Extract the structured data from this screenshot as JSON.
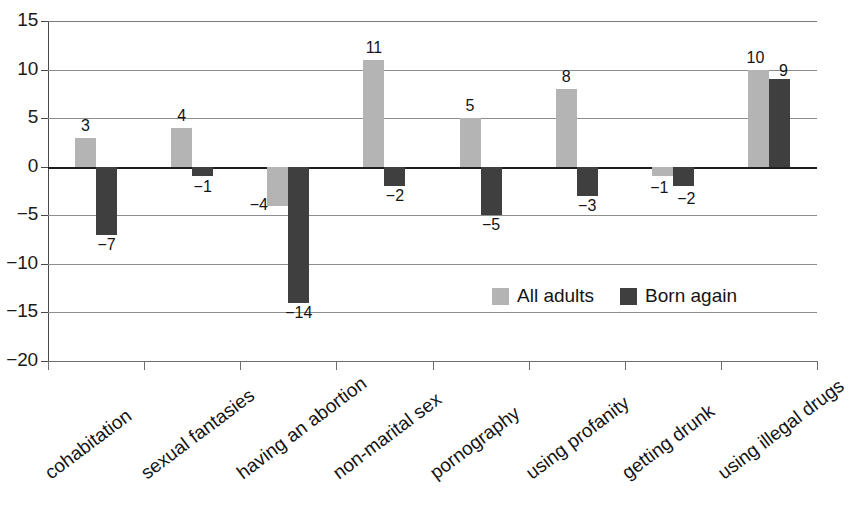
{
  "chart_data": {
    "type": "bar",
    "title": "",
    "subtitle": "",
    "xlabel": "",
    "ylabel": "",
    "ylim": [
      -20,
      15
    ],
    "ytick_values": [
      15,
      10,
      5,
      0,
      -5,
      -10,
      -15,
      -20
    ],
    "ytick_labels": [
      "15",
      "10",
      "5",
      "0",
      "−5",
      "−10",
      "−15",
      "−20"
    ],
    "grid": true,
    "legend_position": "inside-lower-right",
    "categories": [
      "cohabitation",
      "sexual fantasies",
      "having an abortion",
      "non-marital sex",
      "pornography",
      "using profanity",
      "getting drunk",
      "using illegal drugs"
    ],
    "series": [
      {
        "name": "All adults",
        "color": "#b4b4b4",
        "values": [
          3,
          4,
          -4,
          11,
          5,
          8,
          -1,
          10
        ],
        "labels": [
          "3",
          "4",
          "−4",
          "11",
          "5",
          "8",
          "−1",
          "10"
        ]
      },
      {
        "name": "Born again",
        "color": "#3f3f3f",
        "values": [
          -7,
          -1,
          -14,
          -2,
          -5,
          -3,
          -2,
          9
        ],
        "labels": [
          "−7",
          "−1",
          "−14",
          "−2",
          "−5",
          "−3",
          "−2",
          "9"
        ]
      }
    ]
  },
  "legend": {
    "items": [
      {
        "label": "All adults",
        "color": "#b4b4b4"
      },
      {
        "label": "Born again",
        "color": "#3f3f3f"
      }
    ]
  }
}
